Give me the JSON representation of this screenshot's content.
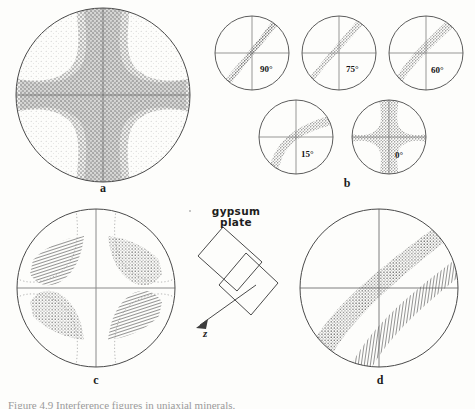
{
  "figure": {
    "caption": "Figure 4.9   Interference figures in uniaxial minerals.",
    "background_color": "#fdfdfb",
    "ink_color": "#3a3a3a",
    "stipple_color": "#6f6f6f",
    "hatch_color": "#4a4a4a"
  },
  "panels": [
    {
      "id": "a",
      "letter": "a",
      "name": "centered-uniaxial-cross",
      "description": "Uniaxial optic axis figure: dark isogyre cross with stippled isochromes",
      "center": {
        "x": 103,
        "y": 95
      },
      "radius": 88,
      "features": [
        "isogyre-cross",
        "isochrome-stipple",
        "crosshair"
      ]
    },
    {
      "id": "b",
      "letter": "b",
      "name": "rotation-series",
      "description": "Off-centre optic axis figure at successive stage rotations",
      "circles": [
        {
          "label": "90°",
          "cx": 252,
          "cy": 53,
          "r": 38,
          "curvature": 0.0
        },
        {
          "label": "75°",
          "cx": 339,
          "cy": 53,
          "r": 38,
          "curvature": 0.22
        },
        {
          "label": "60°",
          "cx": 426,
          "cy": 53,
          "r": 38,
          "curvature": 0.42
        },
        {
          "label": "15°",
          "cx": 296,
          "cy": 137,
          "r": 38,
          "curvature": 0.82
        },
        {
          "label": "0°",
          "cx": 389,
          "cy": 137,
          "r": 38,
          "curvature": 1.0
        }
      ]
    },
    {
      "id": "c",
      "letter": "c",
      "name": "uniaxial-figure-with-gypsum-plate",
      "description": "Uniaxial cross with gypsum plate inserted: blue (hatched) and yellow (stippled) quadrants",
      "center": {
        "x": 96,
        "y": 288
      },
      "radius": 80,
      "quadrants": [
        {
          "position": "upper-left",
          "fill": "hatch",
          "color_name": "blue"
        },
        {
          "position": "upper-right",
          "fill": "stipple",
          "color_name": "yellow"
        },
        {
          "position": "lower-left",
          "fill": "stipple",
          "color_name": "yellow"
        },
        {
          "position": "lower-right",
          "fill": "hatch",
          "color_name": "blue"
        }
      ]
    },
    {
      "id": "d",
      "letter": "d",
      "name": "off-centre-figure-with-gypsum-plate",
      "description": "Off-centre isogyre with gypsum plate: one yellow stippled band and one blue hatched band",
      "center": {
        "x": 379,
        "y": 288
      },
      "radius": 80,
      "bands": [
        {
          "fill": "stipple",
          "color_name": "yellow",
          "offset": -9
        },
        {
          "fill": "hatch",
          "color_name": "blue",
          "offset": 30
        }
      ]
    }
  ],
  "gypsum": {
    "label_line1": "gypsum",
    "label_line2": "plate",
    "axis_label": "z",
    "plate_center": {
      "x": 223,
      "y": 280
    }
  },
  "panel_letters": {
    "a": "a",
    "b": "b",
    "c": "c",
    "d": "d"
  }
}
